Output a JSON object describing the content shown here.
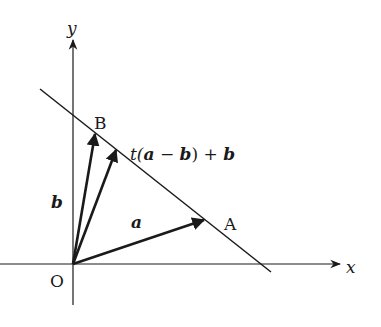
{
  "diagram": {
    "axes": {
      "x_label": "x",
      "y_label": "y",
      "origin_label": "O"
    },
    "points": [
      {
        "name": "A",
        "label": "A"
      },
      {
        "name": "B",
        "label": "B"
      }
    ],
    "vectors": [
      {
        "name": "a",
        "label": "a",
        "from": "O",
        "to": "A"
      },
      {
        "name": "b",
        "label": "b",
        "from": "O",
        "to": "B"
      },
      {
        "name": "p",
        "label_parts": [
          "t(",
          "a",
          " − ",
          "b",
          ") + ",
          "b"
        ],
        "from": "O",
        "to": "point on line AB"
      }
    ],
    "line": {
      "through": [
        "A",
        "B"
      ]
    },
    "colors": {
      "ink": "#1a1a1a",
      "background": "#ffffff"
    }
  }
}
